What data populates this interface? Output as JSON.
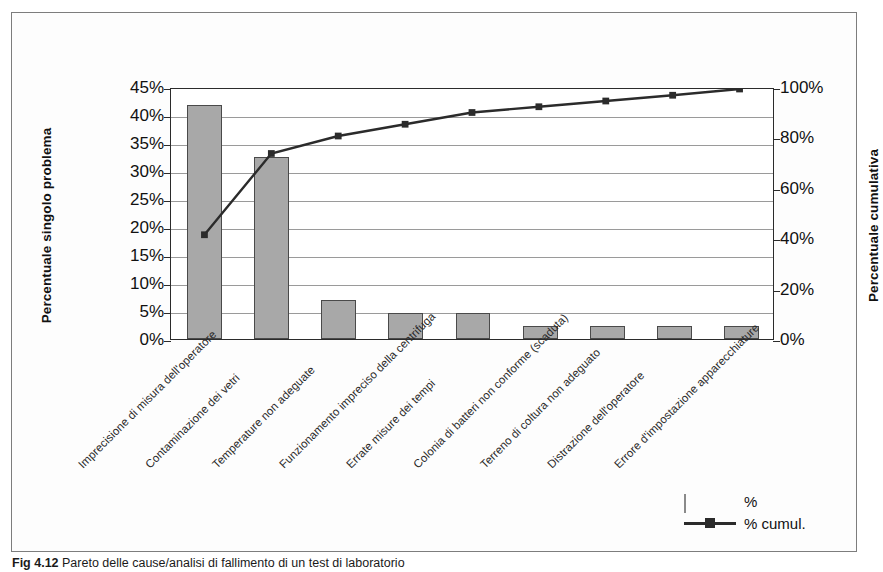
{
  "chart_data": {
    "type": "bar",
    "title": "",
    "subtitle": "",
    "xlabel": "",
    "ylabel": "Percentuale singolo problema",
    "y2label": "Percentuale cumulativa",
    "grid": true,
    "legend_position": "bottom-right",
    "ylim": [
      0,
      45
    ],
    "y2lim": [
      0,
      100
    ],
    "yticks": [
      "0%",
      "5%",
      "10%",
      "15%",
      "20%",
      "25%",
      "30%",
      "35%",
      "40%",
      "45%"
    ],
    "ytick_values": [
      0,
      5,
      10,
      15,
      20,
      25,
      30,
      35,
      40,
      45
    ],
    "y2ticks": [
      "0%",
      "20%",
      "40%",
      "60%",
      "80%",
      "100%"
    ],
    "y2tick_values": [
      0,
      20,
      40,
      60,
      80,
      100
    ],
    "categories": [
      "Imprecisione di misura dell'operatore",
      "Contaminazione dei vetri",
      "Temperature non adeguate",
      "Funzionamento impreciso della centrifuga",
      "Errate misure dei tempi",
      "Colonia di batteri non conforme (scaduta)",
      "Terreno di coltura non adeguato",
      "Distrazione dell'operatore",
      "Errore d'impostazione apparecchiature"
    ],
    "series": [
      {
        "name": "%",
        "type": "bar",
        "axis": "left",
        "color": "#a8a8a8",
        "values": [
          41.7,
          32.5,
          7.0,
          4.7,
          4.7,
          2.3,
          2.3,
          2.3,
          2.3
        ]
      },
      {
        "name": "% cumul.",
        "type": "line",
        "axis": "right",
        "color": "#2b2b2b",
        "marker": "square",
        "values": [
          41.7,
          74.2,
          81.2,
          85.9,
          90.6,
          92.9,
          95.2,
          97.5,
          100.0
        ]
      }
    ]
  },
  "legend": {
    "items": [
      {
        "label": "%",
        "key": "swatch"
      },
      {
        "label": "% cumul.",
        "key": "line-marker"
      }
    ]
  },
  "caption": {
    "number": "Fig 4.12",
    "text": "Pareto delle cause/analisi di fallimento di un test di laboratorio"
  },
  "colors": {
    "bar_fill": "#a8a8a8",
    "bar_stroke": "#4a4a4a",
    "line": "#2b2b2b",
    "grid": "#9a9a9a",
    "axis": "#2b2b2b",
    "frame": "#7d7d7d"
  }
}
